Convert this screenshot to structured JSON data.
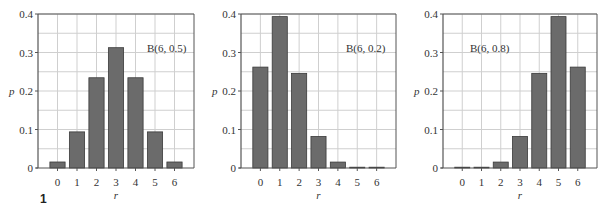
{
  "figure_number": "1",
  "chart_data": [
    {
      "type": "bar",
      "title": "B(6, 0.5)",
      "annotation": "B(6, 0.5)",
      "categories": [
        "0",
        "1",
        "2",
        "3",
        "4",
        "5",
        "6"
      ],
      "values": [
        0.0156,
        0.0938,
        0.2344,
        0.3125,
        0.2344,
        0.0938,
        0.0156
      ],
      "xlabel": "r",
      "ylabel": "p",
      "ylim": [
        0,
        0.4
      ],
      "yticks": [
        "0",
        "0.1",
        "0.2",
        "0.3",
        "0.4"
      ],
      "grid": true,
      "legend": "none"
    },
    {
      "type": "bar",
      "title": "B(6, 0.2)",
      "annotation": "B(6, 0.2)",
      "categories": [
        "0",
        "1",
        "2",
        "3",
        "4",
        "5",
        "6"
      ],
      "values": [
        0.2621,
        0.3932,
        0.2458,
        0.0819,
        0.0154,
        0.0015,
        0.0001
      ],
      "xlabel": "r",
      "ylabel": "p",
      "ylim": [
        0,
        0.4
      ],
      "yticks": [
        "0",
        "0.1",
        "0.2",
        "0.3",
        "0.4"
      ],
      "grid": true,
      "legend": "none"
    },
    {
      "type": "bar",
      "title": "B(6, 0.8)",
      "annotation": "B(6, 0.8)",
      "categories": [
        "0",
        "1",
        "2",
        "3",
        "4",
        "5",
        "6"
      ],
      "values": [
        0.0001,
        0.0015,
        0.0154,
        0.0819,
        0.2458,
        0.3932,
        0.2621
      ],
      "xlabel": "r",
      "ylabel": "p",
      "ylim": [
        0,
        0.4
      ],
      "yticks": [
        "0",
        "0.1",
        "0.2",
        "0.3",
        "0.4"
      ],
      "grid": true,
      "legend": "none"
    }
  ],
  "layout": [
    {
      "axis_x": 38,
      "right_x": 194,
      "annotation_x": 147,
      "annotation_y": 52
    },
    {
      "axis_x": 241,
      "right_x": 396,
      "annotation_x": 346,
      "annotation_y": 52
    },
    {
      "axis_x": 443,
      "right_x": 597,
      "annotation_x": 470,
      "annotation_y": 52
    }
  ],
  "colors": {
    "bar_fill": "#6b6b6b",
    "bar_stroke": "#3a3a3a",
    "grid": "#cfcfcf",
    "axis": "#555555",
    "text": "#333333"
  }
}
